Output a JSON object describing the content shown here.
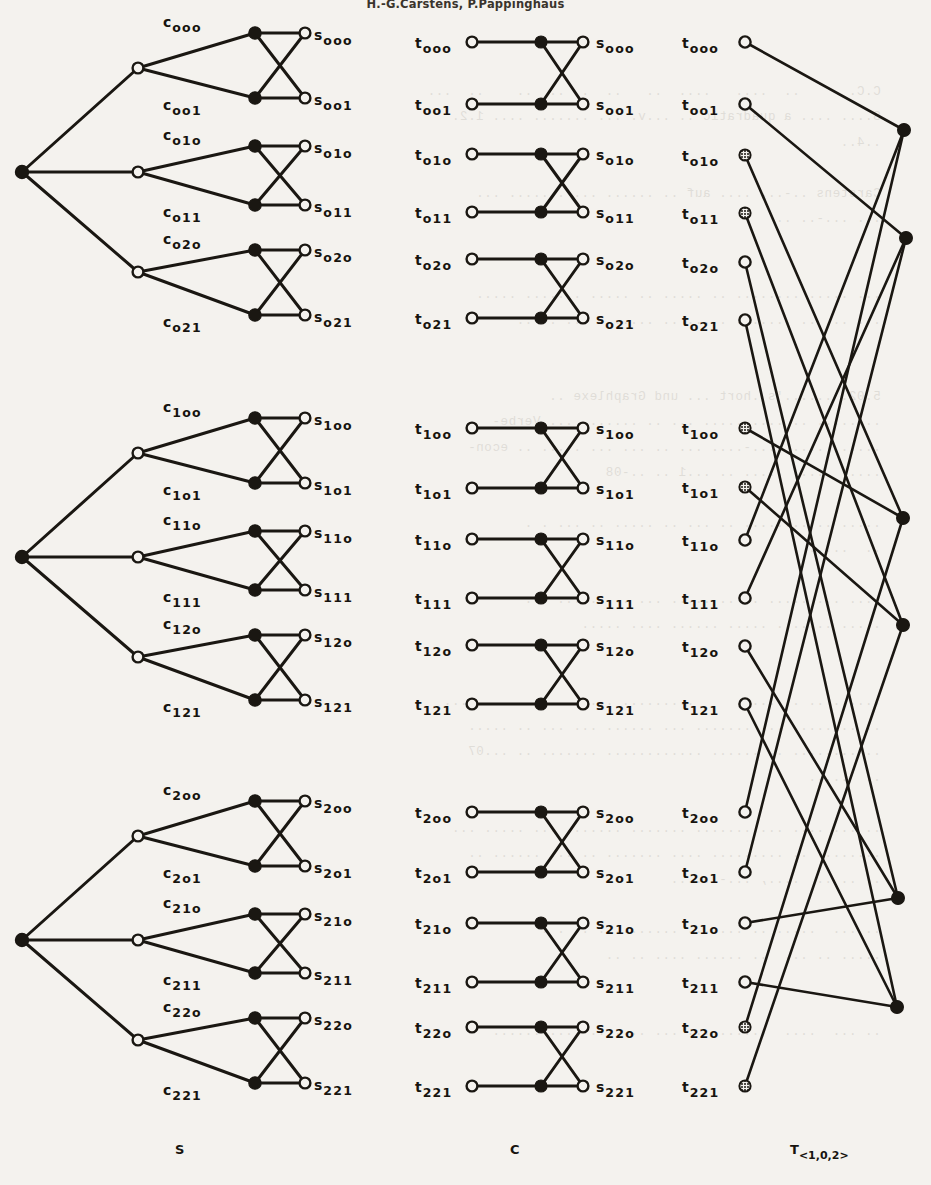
{
  "header": {
    "running_head": "H.-G.Carstens, P.Pappinghaus"
  },
  "column_captions": [
    {
      "name": "caption-S",
      "base": "S",
      "sub": ""
    },
    {
      "name": "caption-C",
      "base": "C",
      "sub": ""
    },
    {
      "name": "caption-T",
      "base": "T",
      "sub": "<1,0,2>"
    }
  ],
  "colors": {
    "ink": "#17140f",
    "line": "#1a1712",
    "paper": "#f4f2ee",
    "node_fill_open": "#f4f2ee",
    "node_fill_solid": "#161310"
  },
  "graph_S": {
    "label": "S",
    "description": "three-level tree: one root, three mid nodes, six c-nodes, six s-nodes",
    "root": {
      "name": "s-root-node",
      "x": 22,
      "y": 172,
      "type": "solid"
    },
    "mid_nodes": [
      {
        "name": "s-mid-node-0",
        "x": 138,
        "y": 68,
        "type": "open"
      },
      {
        "name": "s-mid-node-1",
        "x": 138,
        "y": 172,
        "type": "open"
      },
      {
        "name": "s-mid-node-2",
        "x": 138,
        "y": 272,
        "type": "open"
      }
    ],
    "blocks": [
      {
        "c_top": {
          "label_base": "c",
          "label_sub": "ooo",
          "x": 255,
          "y": 33,
          "lx": 168,
          "ly": 12
        },
        "c_bot": {
          "label_base": "c",
          "label_sub": "oo1",
          "x": 255,
          "y": 98,
          "lx": 168,
          "ly": 86
        },
        "s_top": {
          "label_base": "s",
          "label_sub": "ooo",
          "x": 305,
          "y": 33,
          "lx": 316,
          "ly": 28
        },
        "s_bot": {
          "label_base": "s",
          "label_sub": "oo1",
          "x": 305,
          "y": 98,
          "lx": 316,
          "ly": 93
        },
        "mid": 0
      },
      {
        "c_top": {
          "label_base": "c",
          "label_sub": "o1o",
          "x": 255,
          "y": 146,
          "lx": 168,
          "ly": 126
        },
        "c_bot": {
          "label_base": "c",
          "label_sub": "o11",
          "x": 255,
          "y": 205,
          "lx": 168,
          "ly": 193
        },
        "s_top": {
          "label_base": "s",
          "label_sub": "o1o",
          "x": 305,
          "y": 146,
          "lx": 316,
          "ly": 141
        },
        "s_bot": {
          "label_base": "s",
          "label_sub": "o11",
          "x": 305,
          "y": 205,
          "lx": 316,
          "ly": 200
        },
        "mid": 1
      },
      {
        "c_top": {
          "label_base": "c",
          "label_sub": "o2o",
          "x": 255,
          "y": 250,
          "lx": 168,
          "ly": 234
        },
        "c_bot": {
          "label_base": "c",
          "label_sub": "o21",
          "x": 255,
          "y": 315,
          "lx": 168,
          "ly": 303
        },
        "s_top": {
          "label_base": "s",
          "label_sub": "o2o",
          "x": 305,
          "y": 250,
          "lx": 316,
          "ly": 245
        },
        "s_bot": {
          "label_base": "s",
          "label_sub": "o21",
          "x": 305,
          "y": 315,
          "lx": 316,
          "ly": 310
        },
        "mid": 2
      }
    ]
  },
  "graph_S_blocks": [
    {
      "group": 0,
      "y_offset": 0,
      "root_y": 172,
      "mid_ys": [
        68,
        172,
        272
      ],
      "subs_c": [
        "ooo",
        "oo1",
        "o1o",
        "o11",
        "o2o",
        "o21"
      ],
      "subs_s": [
        "ooo",
        "oo1",
        "o1o",
        "o11",
        "o2o",
        "o21"
      ]
    },
    {
      "group": 1,
      "y_offset": 385,
      "root_y": 557,
      "mid_ys": [
        453,
        557,
        657
      ],
      "subs_c": [
        "1oo",
        "1o1",
        "11o",
        "111",
        "12o",
        "121"
      ],
      "subs_s": [
        "1oo",
        "1o1",
        "11o",
        "111",
        "12o",
        "121"
      ]
    },
    {
      "group": 2,
      "y_offset": 768,
      "root_y": 940,
      "mid_ys": [
        836,
        940,
        1040
      ],
      "subs_c": [
        "2oo",
        "2o1",
        "21o",
        "211",
        "22o",
        "221"
      ],
      "subs_s": [
        "2oo",
        "2o1",
        "21o",
        "211",
        "22o",
        "221"
      ]
    }
  ],
  "graph_C": {
    "label": "C",
    "description": "nine independent 2x2 crossing gadgets: t-node, solid mid node, s-node",
    "x_t": 472,
    "x_mid": 541,
    "x_s": 583,
    "label_t_x": 415,
    "label_s_x": 596,
    "gadgets": [
      {
        "t_top": "ooo",
        "t_bot": "oo1",
        "s_top": "ooo",
        "s_bot": "oo1",
        "y_top": 42,
        "y_bot": 104
      },
      {
        "t_top": "o1o",
        "t_bot": "o11",
        "s_top": "o1o",
        "s_bot": "o11",
        "y_top": 154,
        "y_bot": 212
      },
      {
        "t_top": "o2o",
        "t_bot": "o21",
        "s_top": "o2o",
        "s_bot": "o21",
        "y_top": 259,
        "y_bot": 318
      },
      {
        "t_top": "1oo",
        "t_bot": "1o1",
        "s_top": "1oo",
        "s_bot": "1o1",
        "y_top": 428,
        "y_bot": 488
      },
      {
        "t_top": "11o",
        "t_bot": "111",
        "s_top": "11o",
        "s_bot": "111",
        "y_top": 539,
        "y_bot": 598
      },
      {
        "t_top": "12o",
        "t_bot": "121",
        "s_top": "12o",
        "s_bot": "121",
        "y_top": 645,
        "y_bot": 704
      },
      {
        "t_top": "2oo",
        "t_bot": "2o1",
        "s_top": "2oo",
        "s_bot": "2o1",
        "y_top": 812,
        "y_bot": 872
      },
      {
        "t_top": "21o",
        "t_bot": "211",
        "s_top": "21o",
        "s_bot": "211",
        "y_top": 923,
        "y_bot": 982
      },
      {
        "t_top": "22o",
        "t_bot": "221",
        "s_top": "22o",
        "s_bot": "221",
        "y_top": 1027,
        "y_bot": 1086
      }
    ]
  },
  "graph_T": {
    "label": "T",
    "label_sub": "<1,0,2>",
    "description": "eighteen t-nodes on the left each joined by a long line to one of six solid nodes on the right",
    "x_t": 745,
    "label_x": 682,
    "t_nodes": [
      {
        "sub": "ooo",
        "y": 42,
        "style": "open",
        "target": 0
      },
      {
        "sub": "oo1",
        "y": 104,
        "style": "open",
        "target": 1
      },
      {
        "sub": "o1o",
        "y": 155,
        "style": "hatched",
        "target": 2
      },
      {
        "sub": "o11",
        "y": 213,
        "style": "hatched",
        "target": 3
      },
      {
        "sub": "o2o",
        "y": 262,
        "style": "open",
        "target": 4
      },
      {
        "sub": "o21",
        "y": 320,
        "style": "open",
        "target": 5
      },
      {
        "sub": "1oo",
        "y": 428,
        "style": "hatched",
        "target": 2
      },
      {
        "sub": "1o1",
        "y": 487,
        "style": "hatched",
        "target": 3
      },
      {
        "sub": "11o",
        "y": 540,
        "style": "open",
        "target": 0
      },
      {
        "sub": "111",
        "y": 598,
        "style": "open",
        "target": 1
      },
      {
        "sub": "12o",
        "y": 646,
        "style": "open",
        "target": 4
      },
      {
        "sub": "121",
        "y": 704,
        "style": "open",
        "target": 5
      },
      {
        "sub": "2oo",
        "y": 812,
        "style": "open",
        "target": 0
      },
      {
        "sub": "2o1",
        "y": 872,
        "style": "open",
        "target": 1
      },
      {
        "sub": "21o",
        "y": 923,
        "style": "open",
        "target": 4
      },
      {
        "sub": "211",
        "y": 982,
        "style": "open",
        "target": 5
      },
      {
        "sub": "22o",
        "y": 1027,
        "style": "hatched",
        "target": 2
      },
      {
        "sub": "221",
        "y": 1086,
        "style": "hatched",
        "target": 3
      }
    ],
    "solid_nodes": [
      {
        "name": "t-solid-node-0",
        "x": 904,
        "y": 130
      },
      {
        "name": "t-solid-node-1",
        "x": 906,
        "y": 238
      },
      {
        "name": "t-solid-node-2",
        "x": 903,
        "y": 518
      },
      {
        "name": "t-solid-node-3",
        "x": 903,
        "y": 625
      },
      {
        "name": "t-solid-node-4",
        "x": 898,
        "y": 898
      },
      {
        "name": "t-solid-node-5",
        "x": 897,
        "y": 1007
      }
    ]
  },
  "captions_row": {
    "y": 1142,
    "S_x": 175,
    "C_x": 510,
    "T_x": 790
  },
  "bleed_text": "                                                                          \n   C.C.      ..  ....   ....  ..   ..  .  ..  ..    ..  ...\n   S.... .... a quadratic .. ...v. ... ....... .... 1.2.\n   ..4..\n\n   Carstens ..-.., .... auf .. ...... ... ....... ...\n   ... ...-.. ..\n\n\n   ... ..... ........ .. ..... .. ..... ....... .....\n   ... ... .. ....... ..... .. ....... ... .. ..\n\n\n   5.02. ......'s .hort ... und Graphlexe ..\n   ........ .. .... ..... ... .. ....... ... Verbe-\n   ...... .... ....-.... ... .. ... ... . ... .. econ-\n   ..... ..... ..... .. ...1 .. ..-08\n\n   ..... .. ........ .. ... .. ..... .. ... . .\n   ..  .....\n\n   .... ... ..... .. .. ..... ... ... ..... ...\n   ..... ....... ..... ...... .... .....\n\n\n   ...... .. .. .....     ......... ..... .......... ....\n   .. ........ ... ....... ... ...... ... ... .. .....\n   .. ........ .. ...... ............ ....... .. ...07\n   ..  .....\n\n   .. ... .... ........... ....... ....... ... ..... ...\n   ........ .. ......... .... ....... .. ... ...... ..\n   .. .. ..  ...., ...-......\n\n   .. ...  ..... .. ....... ........ . .. . .\n   ..... .. ...  .. ...... .... .. ..\n\n\n   .. ...  ....  ...... ... ... .... .. .... ......\n"
}
